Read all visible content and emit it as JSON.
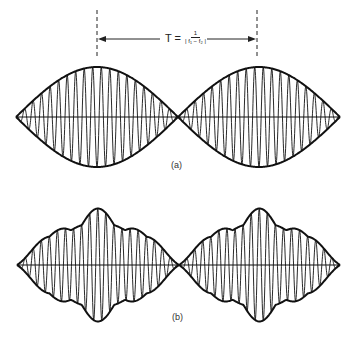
{
  "figure": {
    "formula": {
      "lhs": "T =",
      "numerator": "1",
      "denominator": "| f₁ − f₂ |"
    },
    "panels": [
      {
        "id": "a",
        "label": "(a)",
        "description": "Beat waveform with sinusoidal envelope (two equal-amplitude tones)",
        "envelope": "sinusoidal"
      },
      {
        "id": "b",
        "label": "(b)",
        "description": "Beat waveform with irregular multi-component envelope",
        "envelope": "complex"
      }
    ],
    "period_marker": {
      "x_start": 97,
      "x_end": 257,
      "arrow": "double-headed"
    },
    "colors": {
      "stroke": "#111111",
      "background": "#ffffff",
      "text": "#333333"
    }
  }
}
